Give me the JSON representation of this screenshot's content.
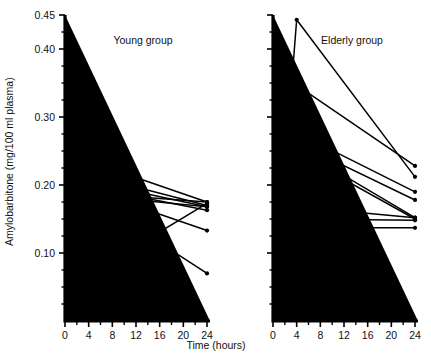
{
  "figure": {
    "ylabel": "Amylobarbitone (mg/100 ml plasma)",
    "xlabel": "Time (hours)"
  },
  "panels": [
    {
      "title": "Young group"
    },
    {
      "title": "Elderly group"
    }
  ],
  "axes": {
    "y_ticks": [
      "0.45",
      "0.40",
      "0.30",
      "0.20",
      "0.10"
    ],
    "y_tick_values": [
      0.45,
      0.4,
      0.3,
      0.2,
      0.1
    ],
    "x_ticks": [
      "0",
      "4",
      "8",
      "12",
      "16",
      "20",
      "24"
    ],
    "x_tick_values": [
      0,
      4,
      8,
      12,
      16,
      20,
      24
    ],
    "y_min": 0,
    "y_max": 0.45,
    "x_min": 0,
    "x_max": 24,
    "y_minor_step": 0.025,
    "x_minor_step": 2
  },
  "chart_data": {
    "type": "line",
    "title": "",
    "xlabel": "Time (hours)",
    "ylabel": "Amylobarbitone (mg/100 ml plasma)",
    "xlim": [
      0,
      24
    ],
    "ylim": [
      0,
      0.45
    ],
    "grid": false,
    "legend": "none",
    "x": [
      0,
      4,
      24
    ],
    "panels": [
      {
        "name": "Young group",
        "series": [
          {
            "name": "young-subject-1",
            "values": [
              0,
              0.235,
              0.175
            ]
          },
          {
            "name": "young-subject-2",
            "values": [
              0,
              0.215,
              0.17
            ]
          },
          {
            "name": "young-subject-3",
            "values": [
              0,
              0.205,
              0.168
            ]
          },
          {
            "name": "young-subject-4",
            "values": [
              0,
              0.197,
              0.163
            ]
          },
          {
            "name": "young-subject-5",
            "values": [
              0,
              0.193,
              0.133
            ]
          },
          {
            "name": "young-subject-6",
            "values": [
              0,
              0.188,
              0.175
            ]
          },
          {
            "name": "young-subject-7",
            "values": [
              0,
              0.185,
              0.168
            ]
          },
          {
            "name": "young-subject-8",
            "values": [
              0,
              0.183,
              0.07
            ]
          },
          {
            "name": "young-subject-9",
            "values": [
              0,
              0.068,
              0.173
            ]
          }
        ]
      },
      {
        "name": "Elderly group",
        "series": [
          {
            "name": "elderly-subject-1",
            "values": [
              0,
              0.443,
              0.212
            ]
          },
          {
            "name": "elderly-subject-2",
            "values": [
              0,
              0.347,
              0.228
            ]
          },
          {
            "name": "elderly-subject-3",
            "values": [
              0,
              0.277,
              0.19
            ]
          },
          {
            "name": "elderly-subject-4",
            "values": [
              0,
              0.262,
              0.178
            ]
          },
          {
            "name": "elderly-subject-5",
            "values": [
              0,
              0.255,
              0.152
            ]
          },
          {
            "name": "elderly-subject-6",
            "values": [
              0,
              0.247,
              0.15
            ]
          },
          {
            "name": "elderly-subject-7",
            "values": [
              0,
              0.168,
              0.152
            ]
          },
          {
            "name": "elderly-subject-8",
            "values": [
              0,
              0.15,
              0.148
            ]
          },
          {
            "name": "elderly-subject-9",
            "values": [
              0,
              0.137,
              0.137
            ]
          }
        ]
      }
    ]
  },
  "colors": {
    "line": "#000000",
    "axis": "#000000",
    "background": "#ffffff"
  }
}
